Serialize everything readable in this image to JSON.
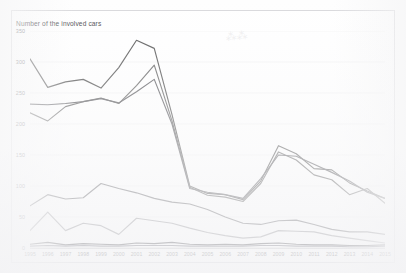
{
  "page": {
    "background_color": "#fefefe",
    "frame_border_color": "#d9d9dc",
    "watermark_text": "⁂⁂"
  },
  "chart_data": {
    "type": "line",
    "title": "Number of the involved cars",
    "xlabel": "",
    "ylabel": "",
    "ylim": [
      0,
      350
    ],
    "yticks": [
      0,
      50,
      100,
      150,
      200,
      250,
      300,
      350
    ],
    "grid": true,
    "legend_position": "none",
    "categories": [
      "1995",
      "1996",
      "1997",
      "1998",
      "1999",
      "2000",
      "2001",
      "2002",
      "2003",
      "2004",
      "2005",
      "2006",
      "2007",
      "2008",
      "2009",
      "2010",
      "2011",
      "2012",
      "2013",
      "2014",
      "2015"
    ],
    "series": [
      {
        "name": "series-1",
        "color": "#585858",
        "values": [
          305,
          259,
          268,
          272,
          258,
          291,
          335,
          322,
          215,
          100,
          88,
          86,
          78,
          108,
          165,
          152,
          128,
          126,
          105,
          92,
          80
        ]
      },
      {
        "name": "series-2",
        "color": "#6a6a6a",
        "values": [
          218,
          205,
          228,
          236,
          242,
          233,
          262,
          295,
          205,
          98,
          85,
          82,
          75,
          104,
          155,
          142,
          118,
          110,
          86,
          96,
          72
        ]
      },
      {
        "name": "series-3",
        "color": "#626266",
        "values": [
          232,
          231,
          233,
          236,
          241,
          234,
          252,
          272,
          200,
          96,
          90,
          86,
          80,
          112,
          150,
          148,
          135,
          122,
          108,
          90,
          80
        ]
      },
      {
        "name": "series-4",
        "color": "#707074",
        "values": [
          68,
          86,
          79,
          81,
          104,
          96,
          89,
          80,
          74,
          71,
          62,
          50,
          40,
          38,
          44,
          45,
          38,
          30,
          26,
          26,
          22
        ]
      },
      {
        "name": "series-5",
        "color": "#98989c",
        "values": [
          28,
          58,
          28,
          40,
          36,
          22,
          48,
          44,
          40,
          32,
          25,
          20,
          16,
          18,
          28,
          27,
          26,
          20,
          16,
          12,
          8
        ]
      },
      {
        "name": "series-6",
        "color": "#4e4e52",
        "values": [
          6,
          9,
          5,
          7,
          6,
          5,
          8,
          7,
          9,
          6,
          5,
          6,
          5,
          7,
          8,
          6,
          5,
          5,
          4,
          4,
          5
        ]
      },
      {
        "name": "series-7",
        "color": "#70707a",
        "values": [
          3,
          4,
          3,
          4,
          3,
          3,
          4,
          4,
          4,
          3,
          3,
          3,
          3,
          4,
          4,
          3,
          3,
          3,
          2,
          2,
          3
        ]
      }
    ]
  }
}
